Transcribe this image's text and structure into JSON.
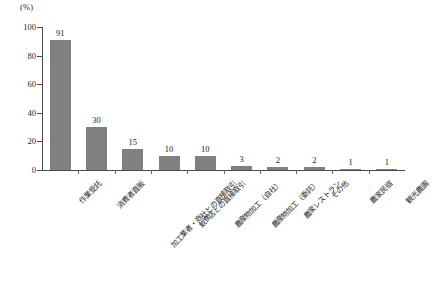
{
  "chart_data": {
    "type": "bar",
    "title": "",
    "subtitle": "",
    "xlabel": "",
    "ylabel": "",
    "unit_label": "(%)",
    "ylim": [
      0,
      100
    ],
    "yticks": [
      0,
      20,
      40,
      60,
      80,
      100
    ],
    "ytick_labels": [
      "0",
      "20",
      "40",
      "60",
      "80",
      "100"
    ],
    "grid": false,
    "legend": false,
    "bar_color": "#808080",
    "axis_color": "#4a4a4a",
    "categories": [
      "作業受託",
      "消費者直販",
      "加工業者・商社との直接取引",
      "飲食店との直接取引",
      "農産物加工（自社）",
      "農産物加工（委託）",
      "農家レストラン",
      "その他",
      "農家民宿",
      "観光農園"
    ],
    "values": [
      91,
      30,
      15,
      10,
      10,
      3,
      2,
      2,
      1,
      1
    ],
    "value_labels": [
      "91",
      "30",
      "15",
      "10",
      "10",
      "3",
      "2",
      "2",
      "1",
      "1"
    ]
  }
}
